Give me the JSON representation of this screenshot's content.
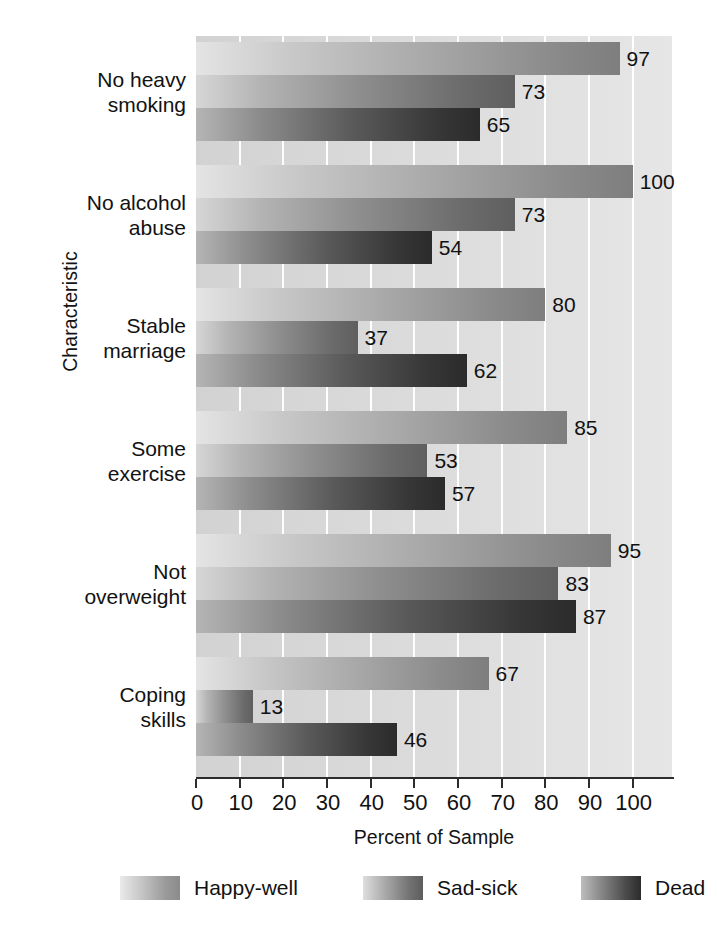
{
  "chart_data": {
    "type": "bar",
    "orientation": "horizontal",
    "title": "",
    "xlabel": "Percent of Sample",
    "ylabel": "Characteristic",
    "xlim": [
      0,
      109
    ],
    "xticks": [
      0,
      10,
      20,
      30,
      40,
      50,
      60,
      70,
      80,
      90,
      100
    ],
    "xtick_labels": [
      "0",
      "10",
      "20",
      "30",
      "40",
      "50",
      "60",
      "70",
      "80",
      "90",
      "100"
    ],
    "grid": "vertical-white-gridlines",
    "legend_position": "bottom",
    "categories": [
      "No heavy smoking",
      "No alcohol abuse",
      "Stable marriage",
      "Some exercise",
      "Not overweight",
      "Coping skills"
    ],
    "category_lines": [
      [
        "No heavy",
        "smoking"
      ],
      [
        "No alcohol",
        "abuse"
      ],
      [
        "Stable",
        "marriage"
      ],
      [
        "Some",
        "exercise"
      ],
      [
        "Not",
        "overweight"
      ],
      [
        "Coping",
        "skills"
      ]
    ],
    "series": [
      {
        "name": "Happy-well",
        "values": [
          97,
          100,
          80,
          85,
          95,
          67
        ]
      },
      {
        "name": "Sad-sick",
        "values": [
          73,
          73,
          37,
          53,
          83,
          13
        ]
      },
      {
        "name": "Dead",
        "values": [
          65,
          54,
          62,
          57,
          87,
          46
        ]
      }
    ],
    "data_labels": [
      [
        "97",
        "73",
        "65"
      ],
      [
        "100",
        "73",
        "54"
      ],
      [
        "80",
        "37",
        "62"
      ],
      [
        "85",
        "53",
        "57"
      ],
      [
        "95",
        "83",
        "87"
      ],
      [
        "67",
        "13",
        "46"
      ]
    ]
  },
  "legend": {
    "items": [
      {
        "label": "Happy-well",
        "swatch": "gradient-light"
      },
      {
        "label": "Sad-sick",
        "swatch": "gradient-medium"
      },
      {
        "label": "Dead",
        "swatch": "gradient-dark"
      }
    ]
  },
  "axes": {
    "x_title": "Percent of Sample",
    "y_title": "Characteristic"
  },
  "colors": {
    "plot_background": "#dadada",
    "gridline": "#ffffff",
    "axis_line": "#2d2d2d",
    "text": "#121212"
  }
}
